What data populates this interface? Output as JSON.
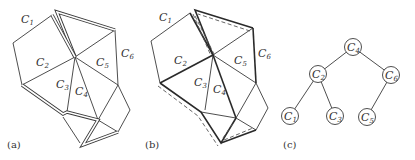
{
  "figure": {
    "panels": [
      {
        "id": "a",
        "label": "(a)",
        "cell_labels": [
          {
            "main": "C",
            "sub": "1"
          },
          {
            "main": "C",
            "sub": "2"
          },
          {
            "main": "C",
            "sub": "3"
          },
          {
            "main": "C",
            "sub": "4"
          },
          {
            "main": "C",
            "sub": "5"
          },
          {
            "main": "C",
            "sub": "6"
          }
        ]
      },
      {
        "id": "b",
        "label": "(b)",
        "cell_labels": [
          {
            "main": "C",
            "sub": "1"
          },
          {
            "main": "C",
            "sub": "2"
          },
          {
            "main": "C",
            "sub": "3"
          },
          {
            "main": "C",
            "sub": "4"
          },
          {
            "main": "C",
            "sub": "5"
          },
          {
            "main": "C",
            "sub": "6"
          }
        ]
      },
      {
        "id": "c",
        "label": "(c)",
        "tree": {
          "root": "C4",
          "nodes": [
            {
              "id": "C4",
              "main": "C",
              "sub": "4"
            },
            {
              "id": "C2",
              "main": "C",
              "sub": "2"
            },
            {
              "id": "C6",
              "main": "C",
              "sub": "6"
            },
            {
              "id": "C1",
              "main": "C",
              "sub": "1"
            },
            {
              "id": "C3",
              "main": "C",
              "sub": "3"
            },
            {
              "id": "C5",
              "main": "C",
              "sub": "5"
            }
          ],
          "edges": [
            [
              "C4",
              "C2"
            ],
            [
              "C4",
              "C6"
            ],
            [
              "C2",
              "C1"
            ],
            [
              "C2",
              "C3"
            ],
            [
              "C6",
              "C5"
            ]
          ]
        }
      }
    ]
  }
}
